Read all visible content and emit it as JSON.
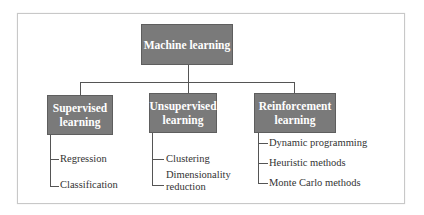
{
  "diagram": {
    "root": {
      "label": "Machine learning"
    },
    "branches": [
      {
        "label_line1": "Supervised",
        "label_line2": "learning",
        "leaves": [
          "Regression",
          "Classification"
        ]
      },
      {
        "label_line1": "Unsupervised",
        "label_line2": "learning",
        "leaves": [
          "Clustering",
          "Dimensionality",
          "reduction"
        ]
      },
      {
        "label_line1": "Reinforcement",
        "label_line2": "learning",
        "leaves": [
          "Dynamic programming",
          "Heuristic methods",
          "Monte Carlo methods"
        ]
      }
    ],
    "colors": {
      "box_fill": "#7a7a7a",
      "box_text": "#ffffff",
      "line": "#555555",
      "leaf_text": "#333333"
    }
  }
}
